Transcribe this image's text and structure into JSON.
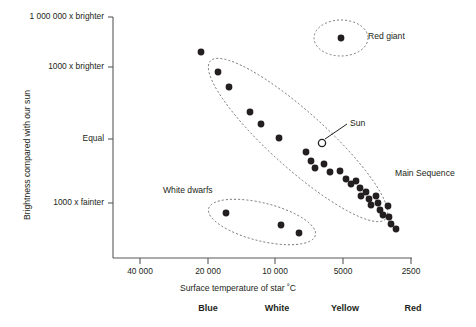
{
  "figure": {
    "type": "hr-diagram",
    "background": "#ffffff",
    "ink": "#231f20",
    "axis_color": "#58595b",
    "dash_color": "#6d6e71"
  },
  "axes": {
    "y_title": "Brightness compared with our sun",
    "x_title": "Surface temperature of star ˚C",
    "y_ticks": [
      {
        "label": "1 000 000 x brighter",
        "py": 17
      },
      {
        "label": "1000 x brighter",
        "py": 67
      },
      {
        "label": "Equal",
        "py": 139
      },
      {
        "label": "1000 x fainter",
        "py": 203
      }
    ],
    "x_ticks": [
      {
        "label": "40 000",
        "px": 140
      },
      {
        "label": "20 000",
        "px": 208
      },
      {
        "label": "10 000",
        "px": 275
      },
      {
        "label": "5000",
        "px": 343
      },
      {
        "label": "2500",
        "px": 411
      }
    ],
    "plot_left": 113,
    "plot_right": 412,
    "plot_top": 17,
    "plot_bottom": 258
  },
  "color_bands": [
    {
      "label": "Blue",
      "px": 208
    },
    {
      "label": "White",
      "px": 277
    },
    {
      "label": "Yellow",
      "px": 345
    },
    {
      "label": "Red",
      "px": 413
    }
  ],
  "annotations": [
    {
      "name": "red-giant-label",
      "text": "Red giant",
      "px": 368,
      "py": 31
    },
    {
      "name": "main-sequence-label",
      "text": "Main Sequence",
      "px": 395,
      "py": 168
    },
    {
      "name": "white-dwarfs-label",
      "text": "White dwarfs",
      "px": 163,
      "py": 185
    },
    {
      "name": "sun-label",
      "text": "Sun",
      "px": 350,
      "py": 118
    }
  ],
  "groups": [
    {
      "name": "main-sequence",
      "cx": 298,
      "cy": 140,
      "rx": 118,
      "ry": 28,
      "rotate": 42
    },
    {
      "name": "red-giants",
      "cx": 341,
      "cy": 38,
      "rx": 27,
      "ry": 18,
      "rotate": 0
    },
    {
      "name": "white-dwarfs",
      "cx": 262,
      "cy": 222,
      "rx": 55,
      "ry": 19,
      "rotate": 14
    }
  ],
  "chart_data": {
    "type": "scatter",
    "xlabel": "Surface temperature of star ˚C",
    "ylabel": "Brightness compared with our sun",
    "x_axis": {
      "scale": "log-reversed",
      "tick_values": [
        40000,
        20000,
        10000,
        5000,
        2500
      ],
      "tick_labels": [
        "40 000",
        "20 000",
        "10 000",
        "5000",
        "2500"
      ],
      "direction": "decreasing left-to-right"
    },
    "y_axis": {
      "scale": "log",
      "tick_values": [
        1000000,
        1000,
        1,
        0.001
      ],
      "tick_labels": [
        "1 000 000 x brighter",
        "1000 x brighter",
        "Equal",
        "1000 x fainter"
      ]
    },
    "grid": false,
    "legend": "none",
    "series": [
      {
        "name": "Main Sequence",
        "marker": "filled-circle",
        "color": "#231f20",
        "points": [
          [
            201,
            52
          ],
          [
            218,
            72
          ],
          [
            229,
            87
          ],
          [
            250,
            112
          ],
          [
            261,
            124
          ],
          [
            279,
            138
          ],
          [
            306,
            152
          ],
          [
            311,
            161
          ],
          [
            315,
            168
          ],
          [
            324,
            164
          ],
          [
            330,
            172
          ],
          [
            340,
            171
          ],
          [
            346,
            179
          ],
          [
            351,
            184
          ],
          [
            356,
            181
          ],
          [
            360,
            188
          ],
          [
            361,
            196
          ],
          [
            366,
            192
          ],
          [
            369,
            199
          ],
          [
            371,
            205
          ],
          [
            376,
            196
          ],
          [
            378,
            203
          ],
          [
            380,
            210
          ],
          [
            383,
            215
          ],
          [
            388,
            206
          ],
          [
            389,
            217
          ],
          [
            391,
            224
          ],
          [
            396,
            229
          ]
        ]
      },
      {
        "name": "Red giant",
        "marker": "filled-circle",
        "color": "#231f20",
        "points": [
          [
            341,
            38
          ]
        ]
      },
      {
        "name": "White dwarfs",
        "marker": "filled-circle",
        "color": "#231f20",
        "points": [
          [
            226,
            213
          ],
          [
            281,
            225
          ],
          [
            299,
            233
          ]
        ]
      },
      {
        "name": "Sun",
        "marker": "open-circle",
        "color": "#ffffff",
        "points": [
          [
            322,
            143
          ]
        ]
      }
    ]
  }
}
